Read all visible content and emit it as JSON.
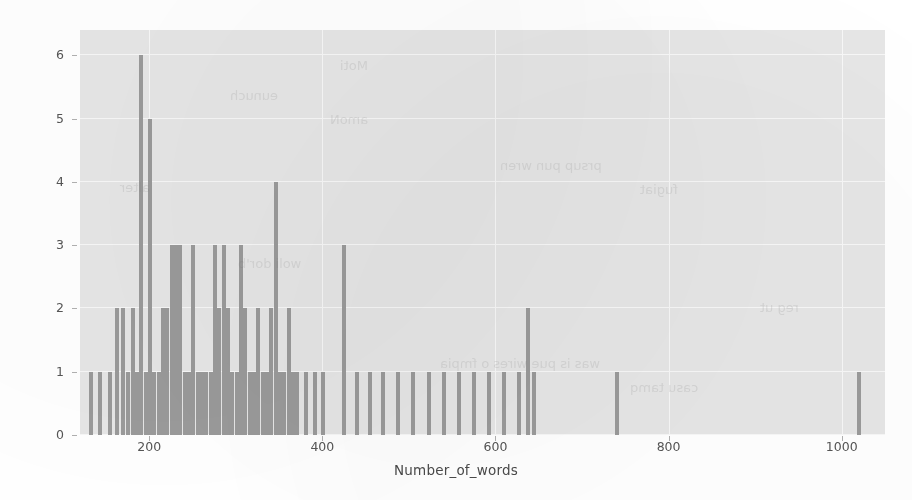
{
  "chart_data": {
    "type": "bar",
    "title": "",
    "subtitle": "",
    "xlabel": "Number_of_words",
    "ylabel": "",
    "xlim": [
      120,
      1050
    ],
    "ylim": [
      0,
      6.4
    ],
    "grid": true,
    "legend": null,
    "bar_color": "#9a9a9a",
    "axes_background": "#e6e6e6",
    "grid_color": "#f7f7f7",
    "tick_color": "#555555",
    "xticks": [
      200,
      400,
      600,
      800,
      1000
    ],
    "yticks": [
      0,
      1,
      2,
      3,
      4,
      5,
      6
    ],
    "xtick_labels": [
      "200",
      "400",
      "600",
      "800",
      "1000"
    ],
    "ytick_labels": [
      "0",
      "1",
      "2",
      "3",
      "4",
      "5",
      "6"
    ],
    "bar_width": 4,
    "x": [
      133,
      143,
      155,
      163,
      170,
      176,
      181,
      186,
      191,
      196,
      201,
      206,
      211,
      216,
      221,
      226,
      231,
      236,
      241,
      246,
      251,
      256,
      261,
      266,
      271,
      276,
      281,
      286,
      291,
      296,
      301,
      306,
      311,
      316,
      321,
      326,
      331,
      336,
      341,
      346,
      351,
      356,
      361,
      366,
      371,
      381,
      391,
      401,
      425,
      440,
      455,
      470,
      487,
      505,
      523,
      540,
      558,
      575,
      592,
      610,
      627,
      637,
      645,
      740,
      1020
    ],
    "values": [
      1,
      1,
      1,
      2,
      2,
      1,
      2,
      1,
      6,
      1,
      5,
      1,
      1,
      2,
      2,
      3,
      3,
      3,
      1,
      1,
      3,
      1,
      1,
      1,
      1,
      3,
      2,
      3,
      2,
      1,
      1,
      3,
      2,
      1,
      1,
      2,
      1,
      1,
      2,
      4,
      1,
      1,
      2,
      1,
      1,
      1,
      1,
      1,
      3,
      1,
      1,
      1,
      1,
      1,
      1,
      1,
      1,
      1,
      1,
      1,
      1,
      2,
      1,
      1,
      1
    ],
    "n_bins": 65
  },
  "axis": {
    "xlabel": "Number_of_words"
  },
  "ghosts": [
    {
      "text": "Moti",
      "left": 340,
      "top": 58
    },
    {
      "text": "eunuch",
      "left": 230,
      "top": 88
    },
    {
      "text": "amoN",
      "left": 330,
      "top": 112
    },
    {
      "text": "prsup pun wren",
      "left": 500,
      "top": 158
    },
    {
      "text": "fugiat",
      "left": 640,
      "top": 182
    },
    {
      "text": "woli dor'b",
      "left": 238,
      "top": 256
    },
    {
      "text": "was is pue wires o fmpia",
      "left": 440,
      "top": 356
    },
    {
      "text": "casu tamq",
      "left": 630,
      "top": 380
    },
    {
      "text": "reg ut",
      "left": 760,
      "top": 300
    },
    {
      "text": "alter",
      "left": 120,
      "top": 180
    }
  ]
}
